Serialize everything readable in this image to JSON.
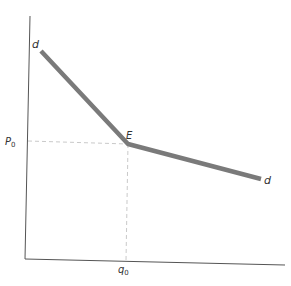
{
  "diagram": {
    "type": "kinked-demand-curve",
    "colors": {
      "axis": "#555555",
      "curve": "#7a7a7a",
      "guide": "#bbbbbb",
      "text": "#333333"
    },
    "labels": {
      "curve_start": "d",
      "curve_end": "d",
      "kink": "E",
      "price_axis_value": "P",
      "price_axis_subscript": "0",
      "quantity_axis_value": "q",
      "quantity_axis_subscript": "0"
    },
    "points": {
      "curve_start": [
        41,
        51
      ],
      "kink": [
        128,
        144
      ],
      "curve_end": [
        261,
        179
      ]
    }
  }
}
